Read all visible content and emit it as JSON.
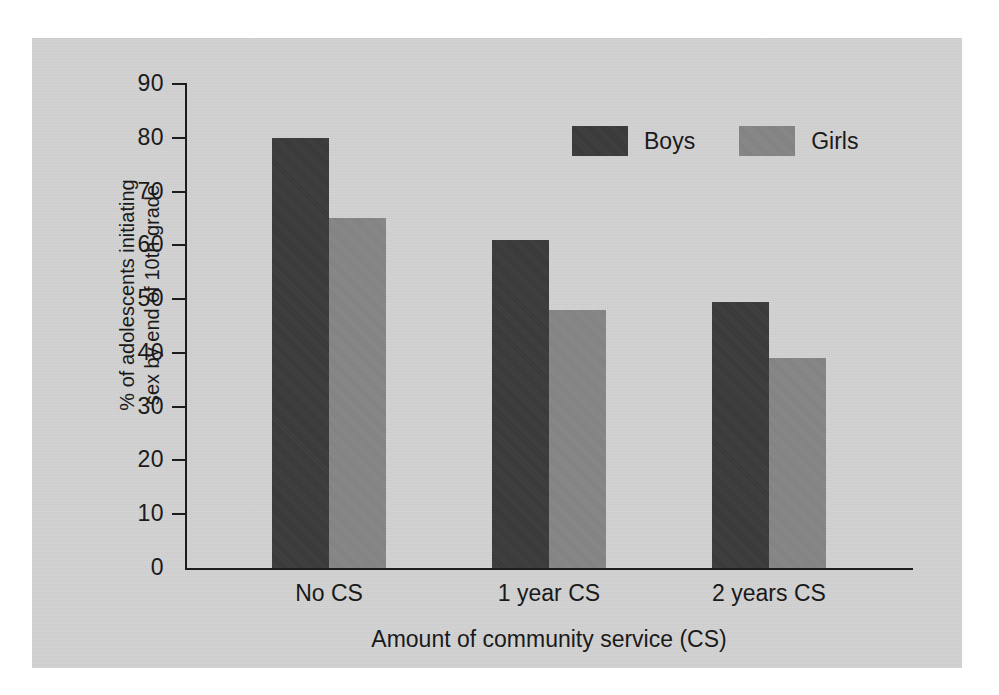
{
  "chart_data": {
    "type": "bar",
    "title": "",
    "subtitle": "",
    "categories": [
      "No CS",
      "1 year CS",
      "2 years CS"
    ],
    "series": [
      {
        "name": "Boys",
        "color": "#3a3a3a",
        "values": [
          80,
          61,
          49.5
        ]
      },
      {
        "name": "Girls",
        "color": "#858585",
        "values": [
          65,
          48,
          39
        ]
      }
    ],
    "xlabel": "Amount of community service (CS)",
    "ylabel": "% of adolescents initiating sex by end of 10th grade",
    "ylabel_line1": "% of adolescents initiating",
    "ylabel_line2": "sex by end of 10th grade",
    "ylim": [
      0,
      90
    ],
    "ytick_step": 10,
    "yticks": [
      0,
      10,
      20,
      30,
      40,
      50,
      60,
      70,
      80,
      90
    ],
    "ytick_labels": [
      "0",
      "10",
      "20",
      "30",
      "40",
      "50",
      "60",
      "70",
      "80",
      "90"
    ],
    "grid": false,
    "legend_position": "top-right",
    "legend": [
      "Boys",
      "Girls"
    ],
    "background_color": "#d2d2d2",
    "axis_color": "#1d1d1d"
  }
}
